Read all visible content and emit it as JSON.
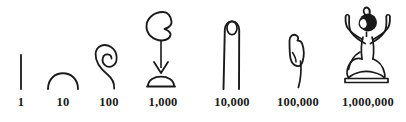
{
  "figure": {
    "background_color": "#ffffff",
    "ink_color": "#1a1a1a"
  },
  "numerals": [
    {
      "label": "1",
      "glyph_name": "single-stroke-glyph",
      "glyph_description": "vertical stroke"
    },
    {
      "label": "10",
      "glyph_name": "heel-bone-arch-glyph",
      "glyph_description": "heel bone arch"
    },
    {
      "label": "100",
      "glyph_name": "coiled-rope-glyph",
      "glyph_description": "coil of rope"
    },
    {
      "label": "1,000",
      "glyph_name": "lotus-flower-glyph",
      "glyph_description": "lotus flower on stem"
    },
    {
      "label": "10,000",
      "glyph_name": "finger-glyph",
      "glyph_description": "pointing finger"
    },
    {
      "label": "100,000",
      "glyph_name": "tadpole-glyph",
      "glyph_description": "tadpole or frog"
    },
    {
      "label": "1,000,000",
      "glyph_name": "heh-god-glyph",
      "glyph_description": "kneeling god Heh with raised arms"
    }
  ]
}
